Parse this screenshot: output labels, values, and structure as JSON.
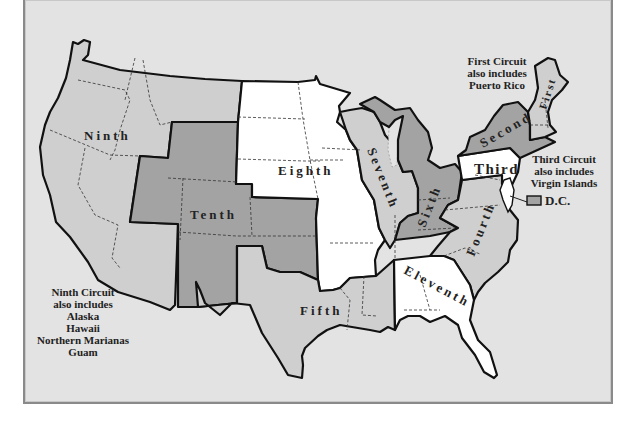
{
  "colors": {
    "background": "#e3e3e3",
    "white_circuits": "#ffffff",
    "light_circuits": "#cfcfcf",
    "dark_circuits": "#a3a3a3",
    "border": "#111111"
  },
  "circuits": [
    {
      "id": "first",
      "label": "First",
      "shade": "light"
    },
    {
      "id": "second",
      "label": "Second",
      "shade": "dark"
    },
    {
      "id": "third",
      "label": "Third",
      "shade": "white"
    },
    {
      "id": "fourth",
      "label": "Fourth",
      "shade": "light"
    },
    {
      "id": "fifth",
      "label": "Fifth",
      "shade": "light"
    },
    {
      "id": "sixth",
      "label": "Sixth",
      "shade": "dark"
    },
    {
      "id": "seventh",
      "label": "Seventh",
      "shade": "light"
    },
    {
      "id": "eighth",
      "label": "Eighth",
      "shade": "white"
    },
    {
      "id": "ninth",
      "label": "Ninth",
      "shade": "light"
    },
    {
      "id": "tenth",
      "label": "Tenth",
      "shade": "dark"
    },
    {
      "id": "eleventh",
      "label": "Eleventh",
      "shade": "white"
    }
  ],
  "notes": {
    "first": [
      "First Circuit",
      "also includes",
      "Puerto Rico"
    ],
    "third": [
      "Third Circuit",
      "also includes",
      "Virgin Islands"
    ],
    "ninth": [
      "Ninth Circuit",
      "also includes",
      "Alaska",
      "Hawaii",
      "Northern Marianas",
      "Guam"
    ]
  },
  "dc_legend": {
    "label": "D.C.",
    "swatch_color": "#a3a3a3"
  }
}
